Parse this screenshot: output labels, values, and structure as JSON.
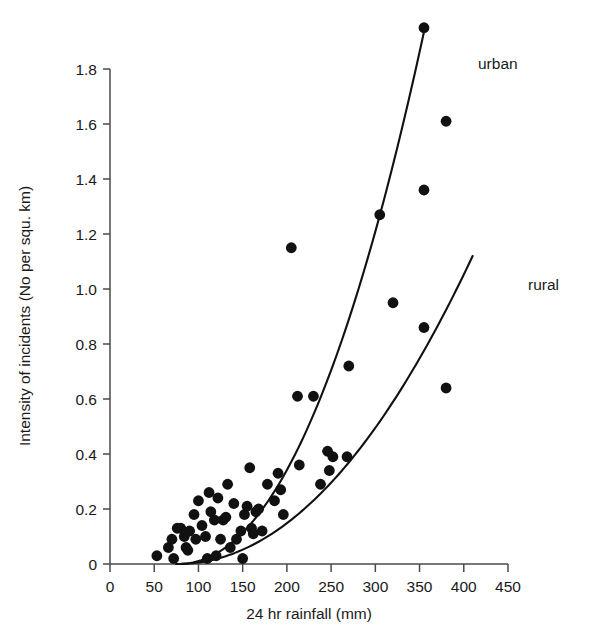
{
  "chart_data": {
    "type": "scatter",
    "title": "",
    "subtitle": "",
    "xlabel": "24 hr rainfall (mm)",
    "ylabel": "Intensity of incidents (No per squ. km)",
    "xlim": [
      0,
      450
    ],
    "ylim": [
      0,
      1.9
    ],
    "xticks": [
      0,
      50,
      100,
      150,
      200,
      250,
      300,
      350,
      400,
      450
    ],
    "xtick_labels": [
      "0",
      "50",
      "100",
      "150",
      "200",
      "250",
      "300",
      "350",
      "400",
      "450"
    ],
    "yticks": [
      0,
      0.2,
      0.4,
      0.6,
      0.8,
      1.0,
      1.2,
      1.4,
      1.6,
      1.8
    ],
    "ytick_labels": [
      "0",
      "0.2",
      "0.4",
      "0.6",
      "0.8",
      "1.0",
      "1.2",
      "1.4",
      "1.6",
      "1.8"
    ],
    "grid": false,
    "legend_position": "inline-curve-labels",
    "marker": "filled-circle",
    "marker_color": "#111111",
    "points": [
      [
        53,
        0.03
      ],
      [
        66,
        0.06
      ],
      [
        70,
        0.09
      ],
      [
        72,
        0.02
      ],
      [
        76,
        0.13
      ],
      [
        80,
        0.13
      ],
      [
        84,
        0.1
      ],
      [
        86,
        0.06
      ],
      [
        88,
        0.05
      ],
      [
        90,
        0.12
      ],
      [
        95,
        0.18
      ],
      [
        97,
        0.09
      ],
      [
        100,
        0.23
      ],
      [
        104,
        0.14
      ],
      [
        108,
        0.1
      ],
      [
        110,
        0.02
      ],
      [
        112,
        0.26
      ],
      [
        114,
        0.19
      ],
      [
        118,
        0.16
      ],
      [
        120,
        0.03
      ],
      [
        122,
        0.24
      ],
      [
        125,
        0.09
      ],
      [
        128,
        0.16
      ],
      [
        131,
        0.17
      ],
      [
        133,
        0.29
      ],
      [
        136,
        0.06
      ],
      [
        140,
        0.22
      ],
      [
        143,
        0.09
      ],
      [
        148,
        0.12
      ],
      [
        150,
        0.02
      ],
      [
        152,
        0.18
      ],
      [
        155,
        0.21
      ],
      [
        158,
        0.35
      ],
      [
        160,
        0.13
      ],
      [
        162,
        0.11
      ],
      [
        165,
        0.19
      ],
      [
        168,
        0.2
      ],
      [
        172,
        0.12
      ],
      [
        178,
        0.29
      ],
      [
        186,
        0.23
      ],
      [
        190,
        0.33
      ],
      [
        193,
        0.27
      ],
      [
        196,
        0.18
      ],
      [
        205,
        1.15
      ],
      [
        212,
        0.61
      ],
      [
        214,
        0.36
      ],
      [
        230,
        0.61
      ],
      [
        238,
        0.29
      ],
      [
        246,
        0.41
      ],
      [
        248,
        0.34
      ],
      [
        252,
        0.39
      ],
      [
        268,
        0.39
      ],
      [
        270,
        0.72
      ],
      [
        305,
        1.27
      ],
      [
        320,
        0.95
      ],
      [
        355,
        1.95
      ],
      [
        355,
        1.36
      ],
      [
        355,
        0.86
      ],
      [
        380,
        1.61
      ],
      [
        380,
        0.64
      ]
    ],
    "series": [
      {
        "name": "urban",
        "type": "fitted-curve",
        "label": "urban",
        "x_start": 75,
        "x_end": 356,
        "y_start": 0,
        "y_end": 1.95
      },
      {
        "name": "rural",
        "type": "fitted-curve",
        "label": "rural",
        "x_start": 75,
        "x_end": 410,
        "y_start": 0,
        "y_end": 1.12
      }
    ]
  },
  "labels": {
    "urban": "urban",
    "rural": "rural"
  }
}
